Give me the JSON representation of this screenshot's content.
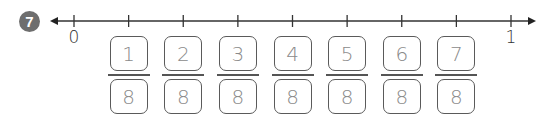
{
  "problem_number": "7",
  "number_line": {
    "start_label": "0",
    "end_label": "1",
    "divisions": 8,
    "x_start": 74,
    "x_end": 511,
    "y": 21
  },
  "fractions": [
    {
      "numerator": "1",
      "denominator": "8"
    },
    {
      "numerator": "2",
      "denominator": "8"
    },
    {
      "numerator": "3",
      "denominator": "8"
    },
    {
      "numerator": "4",
      "denominator": "8"
    },
    {
      "numerator": "5",
      "denominator": "8"
    },
    {
      "numerator": "6",
      "denominator": "8"
    },
    {
      "numerator": "7",
      "denominator": "8"
    }
  ],
  "colors": {
    "line": "#333333",
    "badge": "#6e6e6e",
    "handwriting": "#8a8a8a"
  }
}
